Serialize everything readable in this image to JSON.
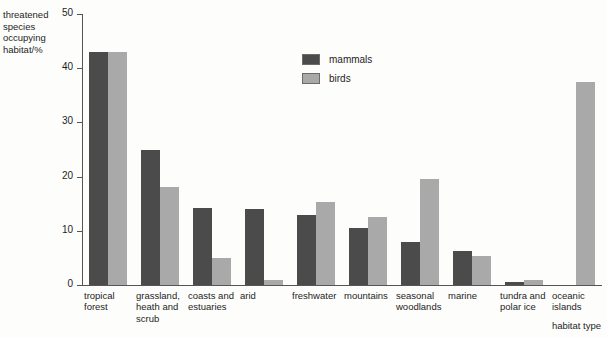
{
  "chart_data": {
    "type": "bar",
    "title": "",
    "xlabel": "habitat type",
    "ylabel": "threatened species occupying habitat/%",
    "ylabel_lines": [
      "threatened",
      "species",
      "occupying",
      "habitat/%"
    ],
    "ylim": [
      0,
      50
    ],
    "yticks": [
      0,
      10,
      20,
      30,
      40,
      50
    ],
    "grid": false,
    "legend_position": "inside-top-center",
    "categories": [
      "tropical forest",
      "grassland, heath and scrub",
      "coasts and estuaries",
      "arid",
      "freshwater",
      "mountains",
      "seasonal woodlands",
      "marine",
      "tundra and polar ice",
      "oceanic islands"
    ],
    "category_label_lines": [
      [
        "tropical",
        "forest"
      ],
      [
        "grassland,",
        "heath and",
        "scrub"
      ],
      [
        "coasts and",
        "estuaries"
      ],
      [
        "arid"
      ],
      [
        "freshwater"
      ],
      [
        "mountains"
      ],
      [
        "seasonal",
        "woodlands"
      ],
      [
        "marine"
      ],
      [
        "tundra and",
        "polar ice"
      ],
      [
        "oceanic",
        "islands"
      ]
    ],
    "series": [
      {
        "name": "mammals",
        "color": "#4b4b4b",
        "values": [
          43,
          25,
          14.3,
          14,
          13,
          10.5,
          8,
          6.2,
          0.6,
          null
        ]
      },
      {
        "name": "birds",
        "color": "#a9a9a9",
        "values": [
          43,
          18,
          5,
          1,
          15.4,
          12.6,
          19.5,
          5.4,
          1,
          37.5
        ]
      }
    ]
  },
  "colors": {
    "mammals": "#4b4b4b",
    "birds": "#a9a9a9",
    "axis": "#555555",
    "text": "#1d1d1d",
    "background": "#fdfdfc"
  }
}
